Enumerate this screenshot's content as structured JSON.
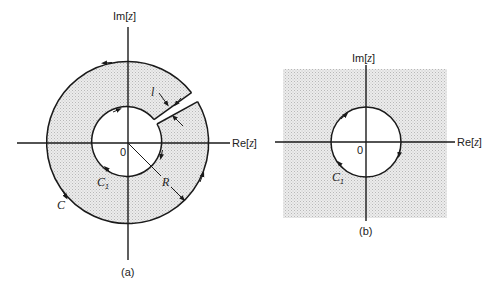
{
  "figure": {
    "panel_a": {
      "caption": "(a)",
      "axis_x_label_prefix": "Re[",
      "axis_x_label_var": "z",
      "axis_x_label_suffix": "]",
      "axis_y_label_prefix": "Im[",
      "axis_y_label_var": "z",
      "axis_y_label_suffix": "]",
      "origin_label": "0",
      "outer_contour_label": "C",
      "inner_contour_label": "C",
      "inner_contour_subscript": "1",
      "radius_label": "R",
      "slit_width_label": "l",
      "region": "shaded annulus with radial slit",
      "orientation_outer": "counter-clockwise",
      "orientation_inner": "clockwise"
    },
    "panel_b": {
      "caption": "(b)",
      "axis_x_label_prefix": "Re[",
      "axis_x_label_var": "z",
      "axis_x_label_suffix": "]",
      "axis_y_label_prefix": "Im[",
      "axis_y_label_var": "z",
      "axis_y_label_suffix": "]",
      "origin_label": "0",
      "contour_label": "C",
      "contour_subscript": "1",
      "region": "shaded plane exterior to circle",
      "orientation": "clockwise"
    },
    "colors": {
      "line": "#1a1a1a",
      "shade": "#d9d9d9",
      "background": "#ffffff"
    }
  }
}
